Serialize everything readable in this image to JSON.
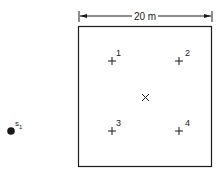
{
  "dimension": {
    "label": "20 m"
  },
  "points": [
    {
      "id": "1",
      "label": "1",
      "x": 112,
      "y": 61
    },
    {
      "id": "2",
      "label": "2",
      "x": 179,
      "y": 61
    },
    {
      "id": "3",
      "label": "3",
      "x": 112,
      "y": 131
    },
    {
      "id": "4",
      "label": "4",
      "x": 179,
      "y": 131
    }
  ],
  "center": {
    "symbol": "×"
  },
  "source": {
    "label": "s",
    "subscript": "1"
  },
  "colors": {
    "ink": "#1a1a1a",
    "background": "#ffffff"
  }
}
